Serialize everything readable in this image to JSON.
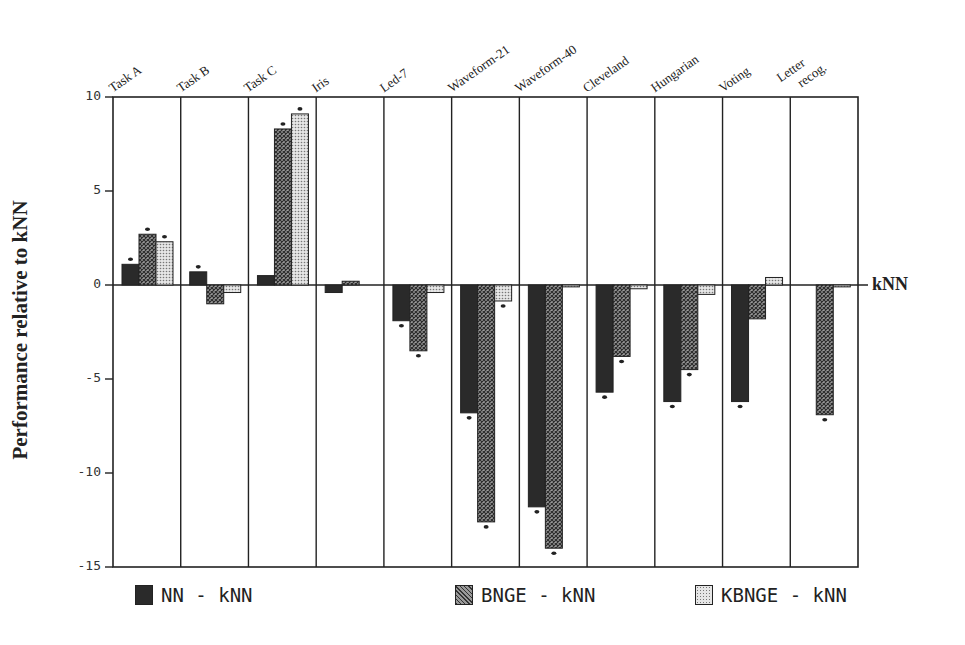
{
  "chart_data": {
    "type": "bar",
    "title": "",
    "xlabel": "",
    "ylabel": "Performance relative to kNN",
    "ylim": [
      -15,
      10
    ],
    "yticks": [
      10,
      5,
      0,
      -5,
      -10,
      -15
    ],
    "reference_line_label": "kNN",
    "grid": false,
    "legend_position": "bottom",
    "categories": [
      "Task A",
      "Task B",
      "Task C",
      "Iris",
      "Led-7",
      "Waveform-21",
      "Waveform-40",
      "Cleveland",
      "Hungarian",
      "Voting",
      "Letter recog."
    ],
    "series": [
      {
        "name": "NN - kNN",
        "values": [
          1.1,
          0.7,
          0.5,
          -0.4,
          -1.9,
          -6.8,
          -11.8,
          -5.7,
          -6.2,
          -6.2,
          0.0
        ],
        "color": "#2a2a2a",
        "pattern": "solid"
      },
      {
        "name": "BNGE - kNN",
        "values": [
          2.7,
          -1.0,
          8.3,
          0.2,
          -3.5,
          -12.6,
          -14.0,
          -3.8,
          -4.5,
          -1.8,
          -6.9
        ],
        "color": "#6a6a6a",
        "pattern": "crosshatch"
      },
      {
        "name": "KBNGE - kNN",
        "values": [
          2.3,
          -0.4,
          9.1,
          0.0,
          -0.4,
          -0.85,
          -0.1,
          -0.2,
          -0.5,
          0.4,
          -0.1
        ],
        "color": "#c8c8c8",
        "pattern": "dotted"
      }
    ],
    "significance_marks": {
      "NN - kNN": [
        true,
        true,
        false,
        false,
        true,
        true,
        true,
        true,
        true,
        true,
        false
      ],
      "BNGE - kNN": [
        true,
        false,
        true,
        false,
        true,
        true,
        true,
        true,
        true,
        false,
        true
      ],
      "KBNGE - kNN": [
        true,
        false,
        true,
        false,
        false,
        true,
        false,
        false,
        false,
        false,
        false
      ]
    }
  },
  "axis": {
    "ylabel": "Performance relative to kNN",
    "ticks": [
      "10",
      "5",
      "0",
      "-5",
      "-10",
      "-15"
    ],
    "zero_label": "kNN"
  },
  "categories": [
    {
      "line1": "Task A",
      "line2": ""
    },
    {
      "line1": "Task B",
      "line2": ""
    },
    {
      "line1": "Task C",
      "line2": ""
    },
    {
      "line1": "Iris",
      "line2": ""
    },
    {
      "line1": "Led-7",
      "line2": ""
    },
    {
      "line1": "Waveform-21",
      "line2": ""
    },
    {
      "line1": "Waveform-40",
      "line2": ""
    },
    {
      "line1": "Cleveland",
      "line2": ""
    },
    {
      "line1": "Hungarian",
      "line2": ""
    },
    {
      "line1": "Voting",
      "line2": ""
    },
    {
      "line1": "Letter",
      "line2": "recog."
    }
  ],
  "legend": [
    {
      "label": "NN - kNN",
      "pattern": "solid"
    },
    {
      "label": "BNGE - kNN",
      "pattern": "crosshatch"
    },
    {
      "label": "KBNGE - kNN",
      "pattern": "dotted"
    }
  ],
  "colors": {
    "axis": "#222222",
    "nn": "#2a2a2a",
    "bnge": "#5a5a5a",
    "kbnge": "#cfcfcf"
  }
}
